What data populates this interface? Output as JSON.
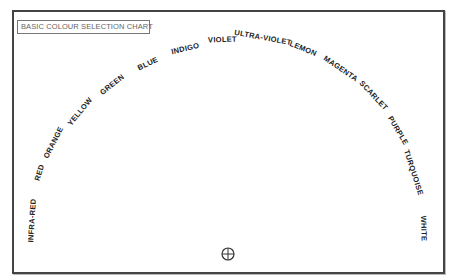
{
  "title": "BASIC COLOUR SELECTION CHART",
  "arc": {
    "center_x": 228,
    "center_y": 232,
    "labels": [
      {
        "text": "INFRA-RED",
        "x": 32,
        "y": 220
      },
      {
        "text": "RED",
        "x": 39,
        "y": 172
      },
      {
        "text": "ORANGE",
        "x": 53,
        "y": 142
      },
      {
        "text": "YELLOW",
        "x": 80,
        "y": 111
      },
      {
        "text": "GREEN",
        "x": 112,
        "y": 84
      },
      {
        "text": "BLUE",
        "x": 148,
        "y": 63
      },
      {
        "text": "INDIGO",
        "x": 185,
        "y": 48
      },
      {
        "text": "VIOLET",
        "x": 222,
        "y": 39
      },
      {
        "text": "ULTRA-VIOLET",
        "x": 263,
        "y": 37
      },
      {
        "text": "LEMON",
        "x": 303,
        "y": 48
      },
      {
        "text": "MAGENTA",
        "x": 340,
        "y": 68
      },
      {
        "text": "SCARLET",
        "x": 374,
        "y": 95
      },
      {
        "text": "PURPLE",
        "x": 398,
        "y": 130
      },
      {
        "text": "TURQUOISE",
        "x": 413,
        "y": 172
      },
      {
        "text": "WHITE",
        "x": 424,
        "y": 228
      }
    ]
  },
  "marker": {
    "icon": "crosshair-circle-icon"
  }
}
